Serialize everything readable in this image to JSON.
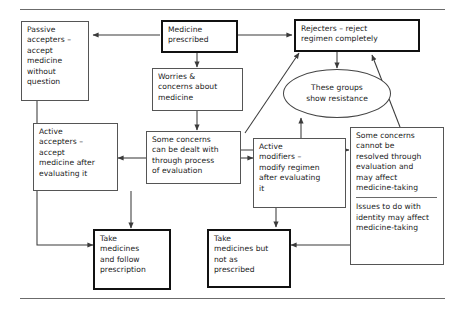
{
  "diagram": {
    "type": "flowchart",
    "title_rule_top": true,
    "title_rule_bottom": true,
    "nodes": [
      {
        "id": "passive-accepters",
        "label": "Passive\naccepters –\naccept\nmedicine\nwithout\nquestion",
        "shape": "rect",
        "emphasis": "normal"
      },
      {
        "id": "medicine-prescribed",
        "label": "Medicine\nprescribed",
        "shape": "rect",
        "emphasis": "bold"
      },
      {
        "id": "rejecters",
        "label": "Rejecters – reject\nregimen completely",
        "shape": "rect",
        "emphasis": "bold"
      },
      {
        "id": "worries-concerns",
        "label": "Worries &\nconcerns about\nmedicine",
        "shape": "rect",
        "emphasis": "normal"
      },
      {
        "id": "these-groups-resistance",
        "label": "These groups\nshow resistance",
        "shape": "ellipse",
        "emphasis": "normal"
      },
      {
        "id": "active-accepters",
        "label": "Active\naccepters –\naccept\nmedicine after\nevaluating it",
        "shape": "rect",
        "emphasis": "normal"
      },
      {
        "id": "some-concerns-dealt",
        "label": "Some concerns\ncan be dealt with\nthrough process\nof evaluation",
        "shape": "rect",
        "emphasis": "normal"
      },
      {
        "id": "active-modifiers",
        "label": "Active\nmodifiers –\nmodify regimen\nafter evaluating\nit",
        "shape": "rect",
        "emphasis": "normal"
      },
      {
        "id": "some-concerns-unresolved",
        "label_part1": "Some concerns\ncannot be\nresolved through\nevaluation and\nmay affect\nmedicine-taking",
        "label_part2": "Issues to do with\nidentity may affect\nmedicine-taking",
        "shape": "rect",
        "emphasis": "normal"
      },
      {
        "id": "take-medicines-follow",
        "label": "Take\nmedicines\nand follow\nprescription",
        "shape": "rect",
        "emphasis": "bold"
      },
      {
        "id": "take-medicines-not-prescribed",
        "label": "Take\nmedicines but\nnot as\nprescribed",
        "shape": "rect",
        "emphasis": "bold"
      }
    ],
    "edges": [
      {
        "from": "medicine-prescribed",
        "to": "passive-accepters"
      },
      {
        "from": "medicine-prescribed",
        "to": "rejecters"
      },
      {
        "from": "medicine-prescribed",
        "to": "worries-concerns"
      },
      {
        "from": "worries-concerns",
        "to": "rejecters"
      },
      {
        "from": "worries-concerns",
        "to": "some-concerns-dealt"
      },
      {
        "from": "rejecters",
        "to": "these-groups-resistance"
      },
      {
        "from": "active-modifiers",
        "to": "these-groups-resistance"
      },
      {
        "from": "some-concerns-dealt",
        "to": "active-accepters"
      },
      {
        "from": "some-concerns-dealt",
        "to": "active-modifiers"
      },
      {
        "from": "some-concerns-dealt",
        "to": "some-concerns-unresolved"
      },
      {
        "from": "some-concerns-unresolved",
        "to": "rejecters"
      },
      {
        "from": "some-concerns-unresolved",
        "to": "take-medicines-not-prescribed"
      },
      {
        "from": "passive-accepters",
        "to": "take-medicines-follow"
      },
      {
        "from": "active-accepters",
        "to": "take-medicines-follow"
      },
      {
        "from": "active-modifiers",
        "to": "take-medicines-not-prescribed"
      }
    ]
  },
  "colors": {
    "stroke": "#555555",
    "stroke_bold": "#111111",
    "rule": "#6b6b6b",
    "text": "#1b1b1b",
    "background": "#ffffff"
  }
}
